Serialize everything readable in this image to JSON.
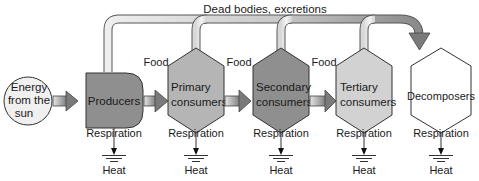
{
  "diagram": {
    "title": "Dead bodies, excretions",
    "colors": {
      "sun_fill": "#f0f0f0",
      "producers_fill": "#8f8f8f",
      "primary_fill": "#b5b5b5",
      "secondary_fill": "#8f8f8f",
      "tertiary_fill": "#d2d2d2",
      "decomposers_fill": "#ffffff",
      "pipe_light": "#e8e8e8",
      "pipe_dark": "#888888",
      "stroke": "#333333"
    },
    "nodes": [
      {
        "id": "sun",
        "lines": [
          "Energy",
          "from the",
          "sun"
        ],
        "shape": "circle"
      },
      {
        "id": "producers",
        "lines": [
          "Producers"
        ],
        "shape": "rounded-rect"
      },
      {
        "id": "primary",
        "lines": [
          "Primary",
          "consumers"
        ],
        "shape": "hexagon"
      },
      {
        "id": "secondary",
        "lines": [
          "Secondary",
          "consumers"
        ],
        "shape": "hexagon"
      },
      {
        "id": "tertiary",
        "lines": [
          "Tertiary",
          "consumers"
        ],
        "shape": "hexagon"
      },
      {
        "id": "decomposers",
        "lines": [
          "Decomposers"
        ],
        "shape": "hexagon"
      }
    ],
    "edges": [
      {
        "from": "sun",
        "to": "producers",
        "label": ""
      },
      {
        "from": "producers",
        "to": "primary",
        "label": "Food"
      },
      {
        "from": "primary",
        "to": "secondary",
        "label": "Food"
      },
      {
        "from": "secondary",
        "to": "tertiary",
        "label": "Food"
      }
    ],
    "outputs": {
      "respiration_label": "Respiration",
      "heat_label": "Heat"
    },
    "food_label": "Food"
  }
}
